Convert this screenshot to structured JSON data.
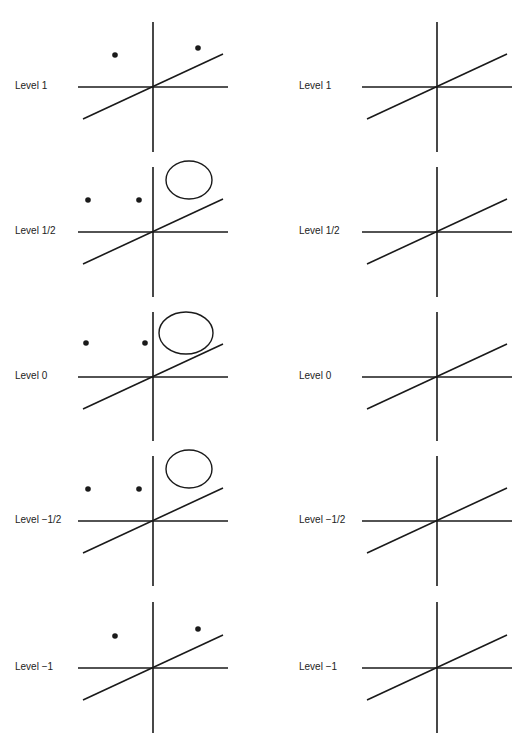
{
  "figure": {
    "stroke_color": "#1a1a1a",
    "background": "#ffffff",
    "columns": [
      {
        "name": "left",
        "axis_x": 153,
        "label_x": 15,
        "panels": [
          {
            "label": "Level 1",
            "axis_y": 87,
            "v_top": 22,
            "v_bottom": 152,
            "dots": [
              [
                115,
                55
              ],
              [
                198,
                48
              ]
            ],
            "ellipse": null
          },
          {
            "label": "Level 1/2",
            "axis_y": 232,
            "v_top": 167,
            "v_bottom": 297,
            "dots": [
              [
                88,
                200
              ],
              [
                139,
                200
              ]
            ],
            "ellipse": {
              "cx": 189,
              "cy": 180,
              "rx": 23,
              "ry": 19
            }
          },
          {
            "label": "Level 0",
            "axis_y": 377,
            "v_top": 312,
            "v_bottom": 441,
            "dots": [
              [
                86,
                343
              ],
              [
                145,
                343
              ]
            ],
            "ellipse": {
              "cx": 186,
              "cy": 333,
              "rx": 27,
              "ry": 21
            }
          },
          {
            "label": "Level −1/2",
            "axis_y": 521,
            "v_top": 456,
            "v_bottom": 586,
            "dots": [
              [
                88,
                489
              ],
              [
                139,
                489
              ]
            ],
            "ellipse": {
              "cx": 189,
              "cy": 469,
              "rx": 23,
              "ry": 19
            }
          },
          {
            "label": "Level −1",
            "axis_y": 668,
            "v_top": 602,
            "v_bottom": 733,
            "dots": [
              [
                115,
                636
              ],
              [
                198,
                629
              ]
            ],
            "ellipse": null
          }
        ]
      },
      {
        "name": "right",
        "axis_x": 437,
        "label_x": 299,
        "panels": [
          {
            "label": "Level 1",
            "axis_y": 87,
            "v_top": 22,
            "v_bottom": 152,
            "dots": [],
            "ellipse": null
          },
          {
            "label": "Level 1/2",
            "axis_y": 232,
            "v_top": 167,
            "v_bottom": 297,
            "dots": [],
            "ellipse": null
          },
          {
            "label": "Level 0",
            "axis_y": 377,
            "v_top": 312,
            "v_bottom": 441,
            "dots": [],
            "ellipse": null
          },
          {
            "label": "Level −1/2",
            "axis_y": 521,
            "v_top": 456,
            "v_bottom": 586,
            "dots": [],
            "ellipse": null
          },
          {
            "label": "Level −1",
            "axis_y": 668,
            "v_top": 602,
            "v_bottom": 733,
            "dots": [],
            "ellipse": null
          }
        ]
      }
    ],
    "axis_geometry": {
      "h_left_offset": -75,
      "h_right_offset": 75,
      "diag_start": [
        -70,
        32
      ],
      "diag_end": [
        70,
        -33
      ]
    }
  }
}
